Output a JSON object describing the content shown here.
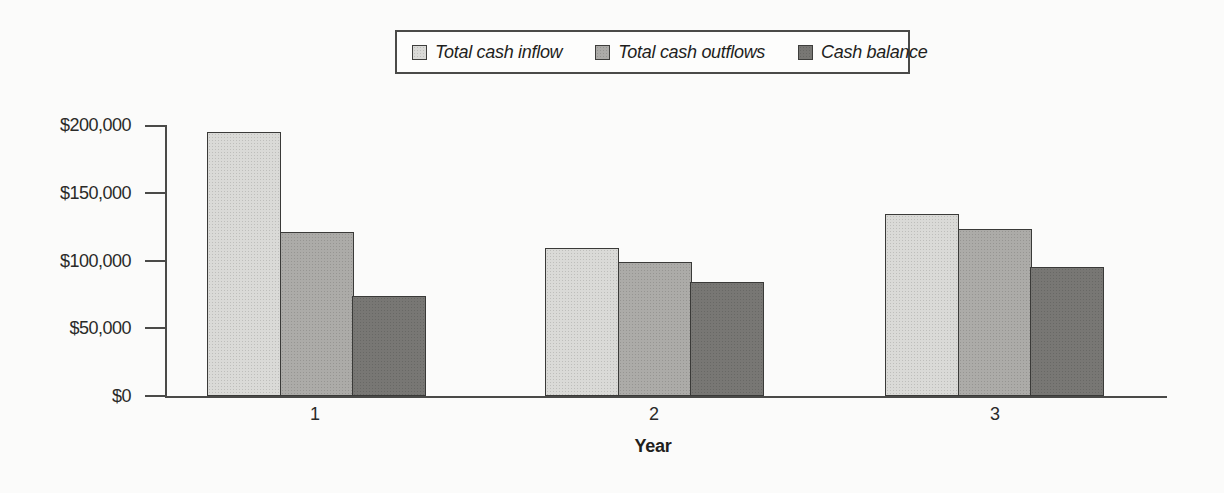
{
  "chart_data": {
    "type": "bar",
    "categories": [
      "1",
      "2",
      "3"
    ],
    "series": [
      {
        "name": "Total cash inflow",
        "color": "#dadad7",
        "values": [
          195000,
          109000,
          134000
        ]
      },
      {
        "name": "Total cash outflows",
        "color": "#acaba8",
        "values": [
          121000,
          99000,
          123000
        ]
      },
      {
        "name": "Cash balance",
        "color": "#787774",
        "values": [
          74000,
          84000,
          95000
        ]
      }
    ],
    "title": "",
    "xlabel": "Year",
    "ylabel": "",
    "ylim": [
      0,
      200000
    ],
    "ytick_interval": 50000,
    "ytick_labels": [
      "$0",
      "$50,000",
      "$100,000",
      "$150,000",
      "$200,000"
    ],
    "grid": false,
    "legend_position": "top-center",
    "axis_color": "#4a4a48",
    "bar_outline_color": "#3a3a38"
  }
}
